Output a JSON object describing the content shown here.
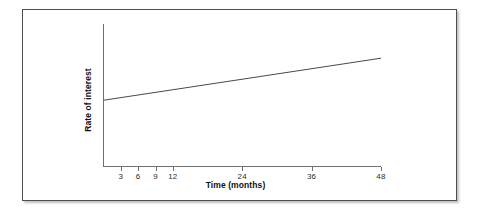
{
  "figure": {
    "frame_border_color": "#4e4e4e",
    "background_color": "#ffffff"
  },
  "chart_data": {
    "type": "line",
    "title": "",
    "subtitle": "",
    "xlabel": "Time (months)",
    "ylabel": "Rate of interest",
    "xlim": [
      0,
      48
    ],
    "ylim": [
      0,
      1
    ],
    "grid": false,
    "legend": false,
    "legend_position": "none",
    "x_tick_labels": [
      "3",
      "6",
      "9",
      "12",
      "24",
      "36",
      "48"
    ],
    "x_tick_values": [
      3,
      6,
      9,
      12,
      24,
      36,
      48
    ],
    "y_tick_labels": [],
    "y_tick_values": [],
    "axis_color": "#6f6f6f",
    "series": [
      {
        "name": "Rate of interest",
        "color": "#4a4a4a",
        "markers": false,
        "x": [
          0,
          48
        ],
        "values": [
          0.465,
          0.76
        ]
      }
    ],
    "annotations": []
  }
}
